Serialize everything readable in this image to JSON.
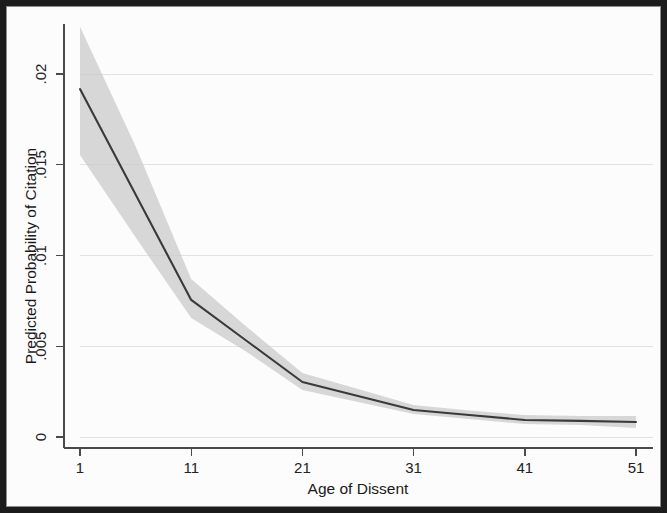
{
  "figure": {
    "background_color": "#fcfcfc",
    "frame_color": "#1c1c1c"
  },
  "chart_data": {
    "type": "line",
    "title": "",
    "subtitle": "",
    "xlabel": "Age of Dissent",
    "ylabel": "Predicted Probability of Citation",
    "xlim": [
      1,
      51
    ],
    "ylim": [
      0,
      0.0225
    ],
    "grid": true,
    "legend": null,
    "x_ticks": [
      1,
      11,
      21,
      31,
      41,
      51
    ],
    "x_tick_labels": [
      "1",
      "11",
      "21",
      "31",
      "41",
      "51"
    ],
    "y_ticks": [
      0,
      0.005,
      0.01,
      0.015,
      0.02
    ],
    "y_tick_labels": [
      "0",
      ".005",
      ".01",
      ".015",
      ".02"
    ],
    "x": [
      1,
      6,
      11,
      16,
      21,
      26,
      31,
      36,
      41,
      46,
      51
    ],
    "series": [
      {
        "name": "Predicted probability",
        "values": [
          0.01917,
          0.01336,
          0.00755,
          0.00529,
          0.00303,
          0.00226,
          0.00149,
          0.00121,
          0.00094,
          0.00089,
          0.00083
        ]
      }
    ],
    "confidence_band": {
      "name": "95% confidence interval",
      "lower": [
        0.01554,
        0.011,
        0.00656,
        0.00468,
        0.00259,
        0.00193,
        0.00127,
        0.00099,
        0.00072,
        0.00066,
        0.0005
      ],
      "upper": [
        0.0226,
        0.01602,
        0.0087,
        0.00606,
        0.00353,
        0.00264,
        0.00176,
        0.00146,
        0.00121,
        0.00116,
        0.00116
      ]
    },
    "colors": {
      "line": "#3a3a3a",
      "band": "#c9c9c9",
      "grid": "#e2e2e2",
      "axis": "#4a4a4a"
    }
  },
  "axes": {
    "x_title": "Age of Dissent",
    "y_title": "Predicted Probability of Citation",
    "x_labels": [
      "1",
      "11",
      "21",
      "31",
      "41",
      "51"
    ],
    "y_labels": [
      "0",
      ".005",
      ".01",
      ".015",
      ".02"
    ]
  }
}
